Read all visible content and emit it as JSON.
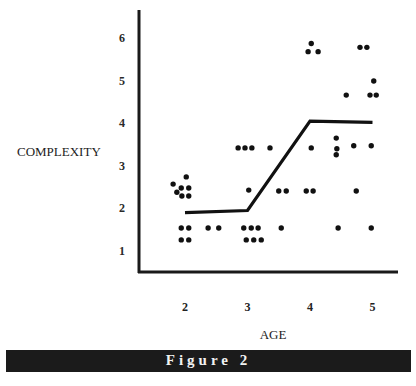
{
  "chart_data": {
    "type": "scatter",
    "title": "",
    "xlabel": "AGE",
    "ylabel": "COMPLEXITY",
    "x_ticks": [
      2,
      3,
      4,
      5
    ],
    "y_ticks": [
      1,
      2,
      3,
      4,
      5,
      6
    ],
    "xlim": [
      1.25,
      5.4
    ],
    "ylim": [
      0.5,
      6.5
    ],
    "grid": false,
    "legend": null,
    "series": [
      {
        "name": "observations",
        "type": "scatter",
        "points": [
          [
            2.02,
            2.74
          ],
          [
            1.81,
            2.57
          ],
          [
            1.94,
            2.48
          ],
          [
            2.06,
            2.48
          ],
          [
            1.87,
            2.38
          ],
          [
            1.95,
            2.29
          ],
          [
            2.06,
            2.29
          ],
          [
            1.94,
            1.54
          ],
          [
            2.06,
            1.54
          ],
          [
            1.94,
            1.26
          ],
          [
            2.06,
            1.26
          ],
          [
            2.37,
            1.54
          ],
          [
            2.54,
            1.54
          ],
          [
            2.94,
            1.54
          ],
          [
            3.06,
            1.54
          ],
          [
            3.17,
            1.54
          ],
          [
            3.54,
            1.54
          ],
          [
            2.98,
            1.26
          ],
          [
            3.1,
            1.26
          ],
          [
            3.22,
            1.26
          ],
          [
            2.85,
            3.42
          ],
          [
            2.96,
            3.42
          ],
          [
            3.07,
            3.42
          ],
          [
            3.36,
            3.42
          ],
          [
            3.02,
            2.43
          ],
          [
            3.5,
            2.41
          ],
          [
            3.62,
            2.41
          ],
          [
            4.02,
            5.87
          ],
          [
            3.97,
            5.68
          ],
          [
            4.13,
            5.68
          ],
          [
            4.02,
            3.42
          ],
          [
            4.42,
            3.65
          ],
          [
            4.43,
            3.4
          ],
          [
            4.42,
            3.26
          ],
          [
            4.7,
            3.47
          ],
          [
            4.98,
            3.47
          ],
          [
            3.94,
            2.41
          ],
          [
            4.05,
            2.41
          ],
          [
            4.74,
            2.41
          ],
          [
            4.45,
            1.54
          ],
          [
            4.98,
            1.54
          ],
          [
            4.8,
            5.78
          ],
          [
            4.91,
            5.78
          ],
          [
            5.02,
            4.99
          ],
          [
            4.96,
            4.66
          ],
          [
            5.06,
            4.66
          ],
          [
            4.58,
            4.66
          ]
        ]
      },
      {
        "name": "mean trend",
        "type": "line",
        "x": [
          2,
          3,
          4,
          5
        ],
        "y": [
          1.9,
          1.95,
          4.05,
          4.02
        ]
      }
    ],
    "caption": "Figure 2"
  },
  "figure": {
    "caption": "Figure 2",
    "xlabel": "AGE",
    "ylabel": "COMPLEXITY"
  }
}
